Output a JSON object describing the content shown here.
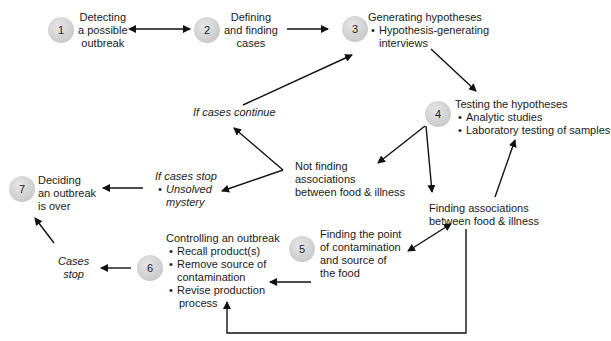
{
  "steps": [
    {
      "number": "1",
      "title": "Detecting a possible outbreak",
      "lines": [
        "Detecting",
        "a possible",
        "outbreak"
      ]
    },
    {
      "number": "2",
      "title": "Defining and finding cases",
      "lines": [
        "Defining",
        "and finding",
        "cases"
      ]
    },
    {
      "number": "3",
      "title": "Generating hypotheses",
      "bullets": [
        "Hypothesis-generating",
        "interviews"
      ]
    },
    {
      "number": "4",
      "title": "Testing the hypotheses",
      "bullets": [
        "Analytic studies",
        "Laboratory testing of samples"
      ]
    },
    {
      "number": "5",
      "lines": [
        "Finding the point",
        "of contamination",
        "and source of",
        "the food"
      ]
    },
    {
      "number": "6",
      "title": "Controlling an outbreak",
      "bullets": [
        "Recall product(s)",
        "Remove source of",
        "contamination",
        "Revise production",
        "process"
      ]
    },
    {
      "number": "7",
      "lines": [
        "Deciding",
        "an outbreak",
        "is over"
      ]
    }
  ],
  "branches": {
    "if_continue": "If cases continue",
    "if_stop": "If cases stop",
    "if_stop_bullet": [
      "Unsolved",
      "mystery"
    ],
    "not_finding": [
      "Not finding",
      "associations",
      "between food & illness"
    ],
    "finding": [
      "Finding associations",
      "between food & illness"
    ],
    "cases_stop": [
      "Cases",
      "stop"
    ]
  },
  "colors": {
    "arrow": "#111111",
    "circle": "#cfcfcf"
  }
}
